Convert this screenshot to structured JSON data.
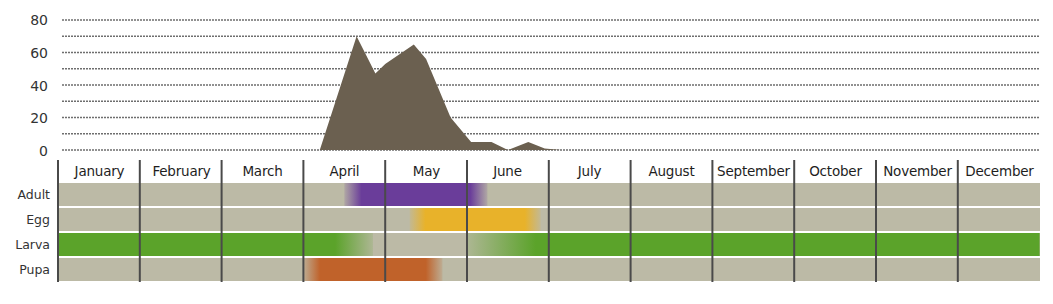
{
  "chart_data": {
    "type": "area",
    "title": "",
    "xlabel": "",
    "ylabel": "",
    "ylim": [
      0,
      80
    ],
    "y_ticks": [
      0,
      20,
      40,
      60,
      80
    ],
    "grid": true,
    "area_color": "#6b6050",
    "series": [
      {
        "name": "Abundance",
        "points_month_fraction": [
          {
            "x": 3.2,
            "y": 0
          },
          {
            "x": 3.65,
            "y": 70
          },
          {
            "x": 3.88,
            "y": 47
          },
          {
            "x": 4.0,
            "y": 53
          },
          {
            "x": 4.35,
            "y": 65
          },
          {
            "x": 4.5,
            "y": 56
          },
          {
            "x": 4.8,
            "y": 20
          },
          {
            "x": 5.05,
            "y": 5
          },
          {
            "x": 5.3,
            "y": 5
          },
          {
            "x": 5.5,
            "y": 0
          },
          {
            "x": 5.75,
            "y": 5
          },
          {
            "x": 5.95,
            "y": 1
          },
          {
            "x": 6.15,
            "y": 0
          }
        ]
      }
    ],
    "categories": [
      "January",
      "February",
      "March",
      "April",
      "May",
      "June",
      "July",
      "August",
      "September",
      "October",
      "November",
      "December"
    ],
    "phenology": {
      "stages": [
        "Adult",
        "Egg",
        "Larva",
        "Pupa"
      ],
      "colors": {
        "Adult": "#6a3d9a",
        "Egg": "#e8b22a",
        "Larva": "#5ba32a",
        "Pupa": "#c0622a",
        "background": "#bcbaa6"
      },
      "periods": [
        {
          "stage": "Adult",
          "start_month": 3.5,
          "end_month": 5.25
        },
        {
          "stage": "Egg",
          "start_month": 4.3,
          "end_month": 5.9
        },
        {
          "stage": "Larva",
          "start_month": 0,
          "end_month": 3.85
        },
        {
          "stage": "Larva",
          "start_month": 5.0,
          "end_month": 12
        },
        {
          "stage": "Pupa",
          "start_month": 3.0,
          "end_month": 4.7
        }
      ]
    }
  },
  "y_axis": {
    "ticks": [
      "80",
      "60",
      "40",
      "20",
      "0"
    ]
  },
  "months": [
    "January",
    "February",
    "March",
    "April",
    "May",
    "June",
    "July",
    "August",
    "September",
    "October",
    "November",
    "December"
  ],
  "stages": [
    "Adult",
    "Egg",
    "Larva",
    "Pupa"
  ]
}
